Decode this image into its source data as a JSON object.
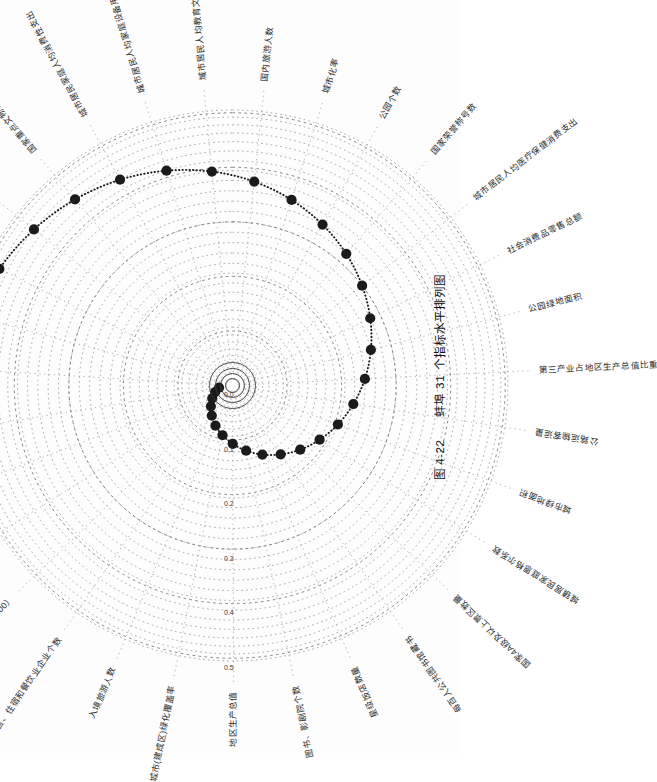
{
  "figure": {
    "caption_prefix": "图 4-22",
    "caption_title": "蚌埠 31 个指标水平排列图",
    "city": "蚌埠",
    "indicator_count": "31"
  },
  "axis": {
    "label_0": "0.0",
    "label_1": "0.1",
    "label_2": "0.2",
    "label_3": "0.3",
    "label_4": "0.4",
    "label_5": "0.5"
  },
  "chart_data": {
    "type": "line",
    "title": "蚌埠 31 个指标水平排列图",
    "subtitle": "图 4-22",
    "xlabel": "",
    "ylabel": "",
    "grid": true,
    "legend": "none",
    "projection": "polar-spiral",
    "rlim": [
      0.0,
      0.55
    ],
    "rticks": [
      0.0,
      0.1,
      0.2,
      0.3,
      0.4,
      0.5
    ],
    "rtick_labels": [
      "0.0",
      "0.1",
      "0.2",
      "0.3",
      "0.4",
      "0.5"
    ],
    "categories": [
      "人均地区生产总值",
      "第三产业就业人数占全部就业人数的比重",
      "城市居民人均交通通信消费支出",
      "城市居民人均可支配收入",
      "国家重点文物保护单位数量",
      "城市居民家庭人均消费性支出",
      "城市居民人均家庭设备用品及服务消费支出",
      "城市居民人均教育文化娱乐服务消费支出",
      "国内旅游人数",
      "城市化率",
      "公园个数",
      "国家荣誉称号数",
      "城市居民人均医疗保健消费支出",
      "社会消费品零售总额",
      "公园绿地面积",
      "第三产业占地区生产总值比重",
      "公路运输客运量",
      "城市绿地面积",
      "城镇居民家庭恩格尔系数",
      "国家4A级及以上景区数量",
      "每百人公共图书馆藏书",
      "星级饭店数量",
      "图书、影剧院个数",
      "地区生产总值",
      "城市(建成区)绿化覆盖率",
      "入境旅游人数",
      "批发、零售、住宿和餐饮业企业个数",
      "城市居民消费价格指数（以上一年为100）",
      "批发、零售、住宿和餐饮业从业人数",
      "住宿和餐饮业零售总额",
      "公共汽车、电车客运量"
    ],
    "values": [
      0.505,
      0.492,
      0.478,
      0.463,
      0.447,
      0.43,
      0.412,
      0.394,
      0.376,
      0.357,
      0.338,
      0.319,
      0.3,
      0.281,
      0.262,
      0.243,
      0.224,
      0.206,
      0.188,
      0.171,
      0.154,
      0.138,
      0.122,
      0.107,
      0.093,
      0.08,
      0.067,
      0.055,
      0.044,
      0.034,
      0.025
    ],
    "marker": "filled-circle",
    "marker_color": "#1b1b1b",
    "line_style": "dotted"
  },
  "labels": [
    {
      "id": "label-1",
      "text": "人均地区生产总值"
    },
    {
      "id": "label-2",
      "text": "第三产业就业人数占全部就业人数的比重"
    },
    {
      "id": "label-3",
      "text": "城市居民人均交通通信消费支出"
    },
    {
      "id": "label-4",
      "text": "城市居民人均可支配收入"
    },
    {
      "id": "label-5",
      "text": "国家重点文物保护单位数量"
    },
    {
      "id": "label-6",
      "text": "城市居民家庭人均消费性支出"
    },
    {
      "id": "label-7",
      "text": "城市居民人均家庭设备用品及服务消费支出"
    },
    {
      "id": "label-8",
      "text": "城市居民人均教育文化娱乐服务消费支出"
    },
    {
      "id": "label-9",
      "text": "国内旅游人数"
    },
    {
      "id": "label-10",
      "text": "城市化率"
    },
    {
      "id": "label-11",
      "text": "公园个数"
    },
    {
      "id": "label-12",
      "text": "国家荣誉称号数"
    },
    {
      "id": "label-13",
      "text": "城市居民人均医疗保健消费支出"
    },
    {
      "id": "label-14",
      "text": "社会消费品零售总额"
    },
    {
      "id": "label-15",
      "text": "公园绿地面积"
    },
    {
      "id": "label-16",
      "text": "第三产业占地区生产总值比重"
    },
    {
      "id": "label-17",
      "text": "公路运输客运量"
    },
    {
      "id": "label-18",
      "text": "城市绿地面积"
    },
    {
      "id": "label-19",
      "text": "城镇居民家庭恩格尔系数"
    },
    {
      "id": "label-20",
      "text": "国家4A级及以上景区数量"
    },
    {
      "id": "label-21",
      "text": "每百人公共图书馆藏书"
    },
    {
      "id": "label-22",
      "text": "星级饭店数量"
    },
    {
      "id": "label-23",
      "text": "图书、影剧院个数"
    },
    {
      "id": "label-24",
      "text": "地区生产总值"
    },
    {
      "id": "label-25",
      "text": "城市(建成区)绿化覆盖率"
    },
    {
      "id": "label-26",
      "text": "入境旅游人数"
    },
    {
      "id": "label-27",
      "text": "批发、零售、住宿和餐饮业企业个数"
    },
    {
      "id": "label-28",
      "text": "城市居民消费价格指数（以上一年为100）"
    },
    {
      "id": "label-29",
      "text": "批发、零售、住宿和餐饮业从业人数"
    },
    {
      "id": "label-30",
      "text": "住宿和餐饮业零售总额"
    },
    {
      "id": "label-31",
      "text": "公共汽车、电车客运量"
    }
  ]
}
